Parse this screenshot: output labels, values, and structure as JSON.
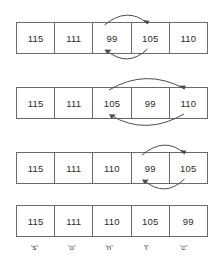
{
  "diagram": {
    "type": "array-swap-steps",
    "colors": {
      "background": "#ffffff",
      "cell_border": "#6b6b6b",
      "text": "#2b2b2b",
      "arrow": "#4d4d4d"
    },
    "steps": [
      {
        "name": "step-1",
        "cells": [
          "115",
          "111",
          "99",
          "105",
          "110"
        ],
        "swap": {
          "from_index": 2,
          "to_index": 3,
          "present": true
        }
      },
      {
        "name": "step-2",
        "cells": [
          "115",
          "111",
          "105",
          "99",
          "110"
        ],
        "swap": {
          "from_index": 2,
          "to_index": 4,
          "present": true
        }
      },
      {
        "name": "step-3",
        "cells": [
          "115",
          "111",
          "110",
          "99",
          "105"
        ],
        "swap": {
          "from_index": 3,
          "to_index": 4,
          "present": true
        }
      },
      {
        "name": "step-4",
        "cells": [
          "115",
          "111",
          "110",
          "105",
          "99"
        ],
        "swap": {
          "from_index": 0,
          "to_index": 0,
          "present": false
        }
      }
    ],
    "char_labels": [
      "'s'",
      "'o'",
      "'n'",
      "'i'",
      "'c'"
    ]
  }
}
